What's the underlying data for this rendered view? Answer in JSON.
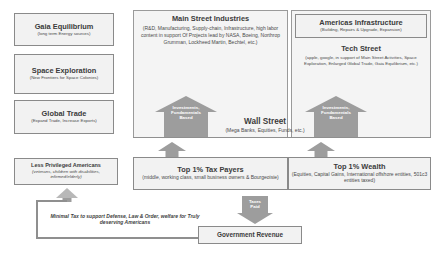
{
  "diagram": {
    "left_column": [
      {
        "title": "Gaia Equilibrium",
        "sub": "(long term Energy sources)"
      },
      {
        "title": "Space Exploration",
        "sub": "(New Frontiers for Space Colonies)"
      },
      {
        "title": "Global Trade",
        "sub": "(Expand Trade, Increase Exports)"
      }
    ],
    "main_street": {
      "title": "Main Street Industries",
      "sub": "(R&D, Manufacturing, Supply-chain, Infrastructure, high labor content in support Of Projects lead by NASA, Boeing, Northrop Grumman, Lockheed Martin, Bechtel, etc.)"
    },
    "right_column": [
      {
        "title": "Americas Infrastructure",
        "sub": "(Building, Repairs & Upgrade, Expansion)"
      },
      {
        "title": "Tech Street",
        "sub": "(apple, google, in support of Main Street Activities, Space Exploration, Enlarged Global Trade, Gaia Equilibrium, etc.)"
      }
    ],
    "wall_street": {
      "title": "Wall Street",
      "sub": "(Mega Banks, Equities, Funds, etc.)"
    },
    "arrows": {
      "investments_left": "Investments,\nFundamentals\nBased",
      "investments_left_lines": [
        "Investments,",
        "Fundamentals",
        "Based"
      ],
      "investments_right_lines": [
        "Investments,",
        "Fundamentals",
        "Based"
      ],
      "taxes_paid_lines": [
        "Taxes",
        "Paid"
      ]
    },
    "bottom_row": {
      "less_privileged": {
        "title": "Less Privileged Americans",
        "sub": "(veterans, children with disabilities, infirmed/elderly)"
      },
      "tax_payers": {
        "title": "Top 1% Tax Payers",
        "sub": "(middle, working class, small business owners & Bourgeoisie)"
      },
      "wealth": {
        "title": "Top 1% Wealth",
        "sub": "(Equities, Capital Gains, International offshore entities, 501c3 entities taxed)"
      }
    },
    "government_revenue": {
      "label": "Government Revenue"
    },
    "minimal_tax_note": "Minimal Tax to support Defense, Law & Order, welfare for Truly deserving Americans"
  }
}
